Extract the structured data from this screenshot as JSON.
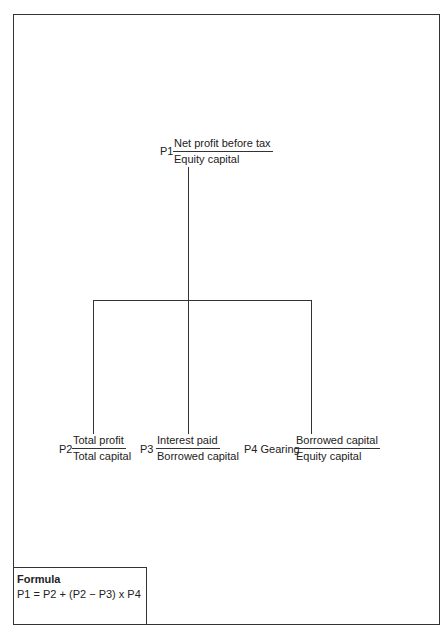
{
  "diagram": {
    "top": {
      "code": "P1",
      "numerator": "Net profit before tax",
      "denominator": "Equity capital"
    },
    "children": [
      {
        "code": "P2",
        "numerator": "Total profit",
        "denominator": "Total capital"
      },
      {
        "code": "P3",
        "numerator": "Interest paid",
        "denominator": "Borrowed capital"
      },
      {
        "code": "P4 Gearing",
        "numerator": "Borrowed capital",
        "denominator": "Equity capital"
      }
    ]
  },
  "formula": {
    "title": "Formula",
    "expression": "P1 = P2 + (P2 − P3) x P4"
  }
}
